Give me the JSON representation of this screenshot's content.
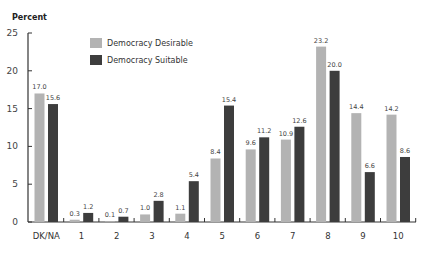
{
  "chart_data": {
    "type": "bar",
    "title": "",
    "xlabel": "",
    "ylabel": "Percent",
    "ylim": [
      0,
      25
    ],
    "yticks": [
      0,
      5,
      10,
      15,
      20,
      25
    ],
    "grid": false,
    "legend_position": "top-left inside",
    "categories": [
      "DK/NA",
      "1",
      "2",
      "3",
      "4",
      "5",
      "6",
      "7",
      "8",
      "9",
      "10"
    ],
    "series": [
      {
        "name": "Democracy Desirable",
        "color": "#b3b3b3",
        "values": [
          17.0,
          0.3,
          0.1,
          1.0,
          1.1,
          8.4,
          9.6,
          10.9,
          23.2,
          14.4,
          14.2
        ],
        "labels": [
          "17.0",
          "0.3",
          "0.1",
          "1.0",
          "1.1",
          "8.4",
          "9.6",
          "10.9",
          "23.2",
          "14.4",
          "14.2"
        ]
      },
      {
        "name": "Democracy Suitable",
        "color": "#3d3d3d",
        "values": [
          15.6,
          1.2,
          0.7,
          2.8,
          5.4,
          15.4,
          11.2,
          12.6,
          20.0,
          6.6,
          8.6
        ],
        "labels": [
          "15.6",
          "1.2",
          "0.7",
          "2.8",
          "5.4",
          "15.4",
          "11.2",
          "12.6",
          "20.0",
          "6.6",
          "8.6"
        ]
      }
    ]
  }
}
